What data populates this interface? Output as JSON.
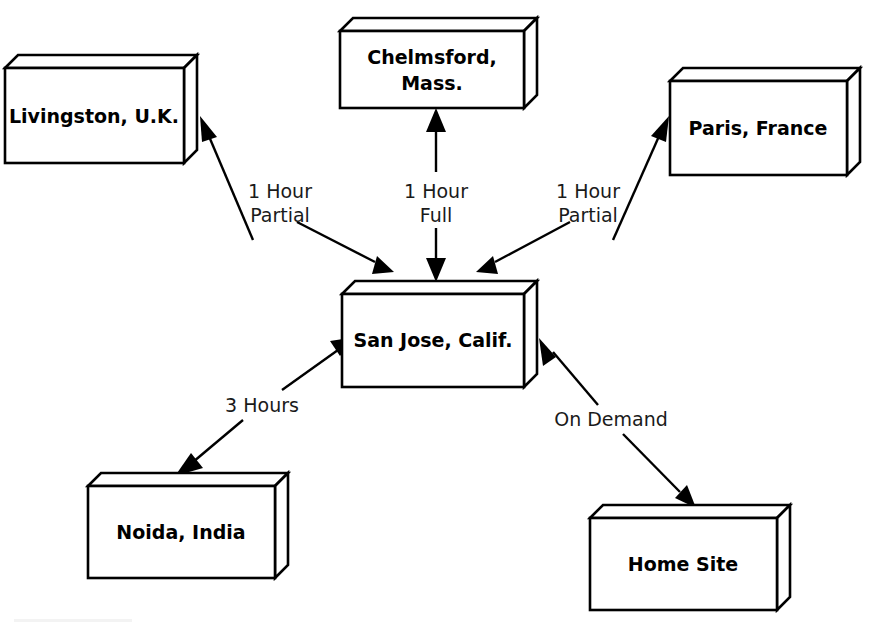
{
  "diagram": {
    "background_color": "#ffffff",
    "line_color": "#000000",
    "text_color": "#000000"
  },
  "nodes": {
    "livingston": {
      "label": "Livingston, U.K."
    },
    "chelmsford": {
      "label_line1": "Chelmsford,",
      "label_line2": "Mass."
    },
    "paris": {
      "label": "Paris, France"
    },
    "san_jose": {
      "label": "San Jose, Calif."
    },
    "noida": {
      "label": "Noida, India"
    },
    "home_site": {
      "label": "Home Site"
    }
  },
  "edges": {
    "livingston_sanjose": {
      "label_line1": "1 Hour",
      "label_line2": "Partial"
    },
    "chelmsford_sanjose": {
      "label_line1": "1 Hour",
      "label_line2": "Full"
    },
    "paris_sanjose": {
      "label_line1": "1 Hour",
      "label_line2": "Partial"
    },
    "noida_sanjose": {
      "label": "3 Hours"
    },
    "homesite_sanjose": {
      "label": "On Demand"
    }
  }
}
